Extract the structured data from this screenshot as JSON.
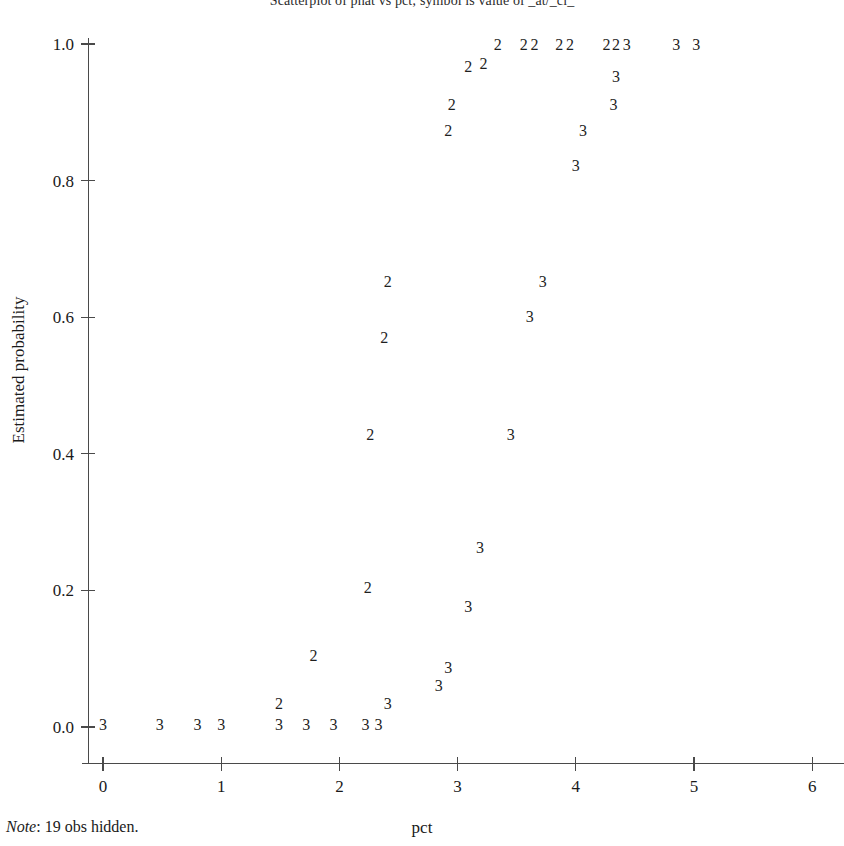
{
  "chart": {
    "title": "Scatterplot of phat vs pct; symbol is value of _at/_cl_",
    "note_word": "Note",
    "note_text": ": 19 obs hidden.",
    "xlabel": "pct",
    "ylabel": "Estimated probability",
    "axis_color": "#4a4a4a",
    "marker_color": "#1f1f1f",
    "background": "#ffffff"
  },
  "chart_data": {
    "type": "scatter",
    "title": "Scatterplot of phat vs pct; symbol is value of _at/_cl_",
    "xlabel": "pct",
    "ylabel": "Estimated probability",
    "xlim": [
      -0.18,
      6.27
    ],
    "ylim": [
      -0.035,
      1.045
    ],
    "xticks": [
      0,
      1,
      2,
      3,
      4,
      5,
      6
    ],
    "xtick_labels": [
      "0",
      "1",
      "2",
      "3",
      "4",
      "5",
      "6"
    ],
    "yticks": [
      0.0,
      0.2,
      0.4,
      0.6,
      0.8,
      1.0
    ],
    "ytick_labels": [
      "0.0",
      "0.2",
      "0.4",
      "0.6",
      "0.8",
      "1.0"
    ],
    "grid": false,
    "legend": null,
    "marker_style": "text-symbol",
    "note": "Note: 19 obs hidden.",
    "series": [
      {
        "name": "2",
        "symbol": "2",
        "points": [
          [
            2.24,
            0.203
          ],
          [
            1.78,
            0.104
          ],
          [
            1.49,
            0.033
          ],
          [
            2.26,
            0.427
          ],
          [
            2.38,
            0.57
          ],
          [
            2.41,
            0.651
          ],
          [
            2.92,
            0.872
          ],
          [
            2.95,
            0.91
          ],
          [
            3.09,
            0.966
          ],
          [
            3.22,
            0.971
          ],
          [
            3.34,
            0.999
          ],
          [
            3.56,
            0.999
          ],
          [
            3.65,
            0.999
          ],
          [
            3.86,
            0.999
          ],
          [
            3.95,
            0.999
          ],
          [
            4.26,
            0.999
          ],
          [
            4.34,
            0.999
          ]
        ]
      },
      {
        "name": "3",
        "symbol": "3",
        "points": [
          [
            0.0,
            0.003
          ],
          [
            0.48,
            0.003
          ],
          [
            0.8,
            0.003
          ],
          [
            1.0,
            0.003
          ],
          [
            1.49,
            0.003
          ],
          [
            1.72,
            0.003
          ],
          [
            1.95,
            0.003
          ],
          [
            2.22,
            0.003
          ],
          [
            2.33,
            0.003
          ],
          [
            2.41,
            0.033
          ],
          [
            2.84,
            0.06
          ],
          [
            2.92,
            0.087
          ],
          [
            3.09,
            0.176
          ],
          [
            3.19,
            0.262
          ],
          [
            3.45,
            0.427
          ],
          [
            3.61,
            0.601
          ],
          [
            3.72,
            0.651
          ],
          [
            4.0,
            0.822
          ],
          [
            4.06,
            0.873
          ],
          [
            4.32,
            0.911
          ],
          [
            4.34,
            0.951
          ],
          [
            4.43,
            0.999
          ],
          [
            4.85,
            0.999
          ],
          [
            5.02,
            0.999
          ]
        ]
      }
    ]
  }
}
